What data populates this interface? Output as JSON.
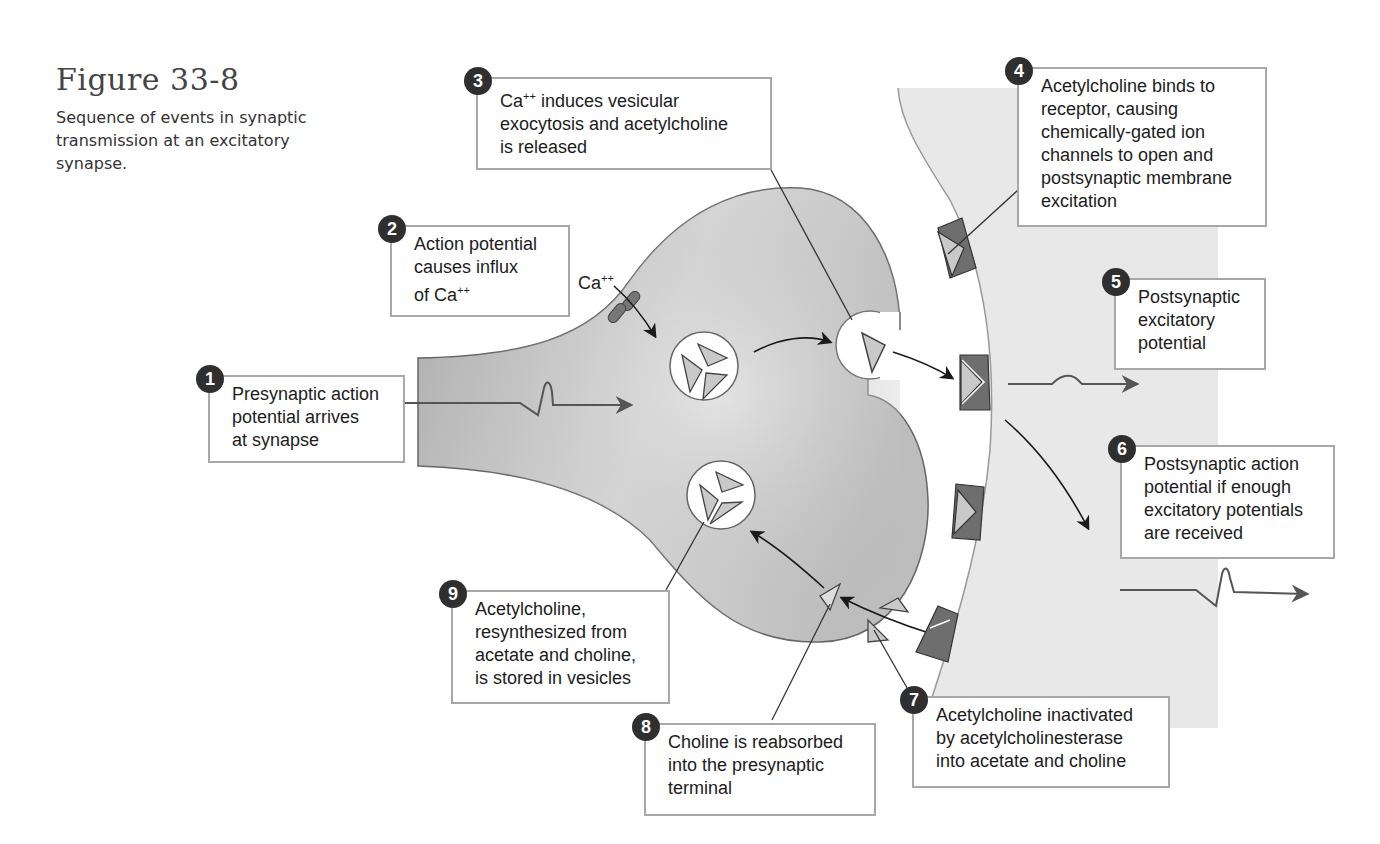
{
  "figure": {
    "title": "Figure 33-8",
    "caption": "Sequence of events in synaptic transmission at an excitatory synapse."
  },
  "labels": {
    "calcium_ion": "Ca",
    "calcium_charge": "++"
  },
  "steps": [
    {
      "number": "1",
      "text": "Presynaptic action\npotential arrives\nat synapse"
    },
    {
      "number": "2",
      "text_pre": "Action potential\ncauses influx\nof Ca",
      "sup": "++"
    },
    {
      "number": "3",
      "text_pre": "Ca",
      "sup": "++",
      "text_post": " induces vesicular\nexocytosis and acetylcholine\nis released"
    },
    {
      "number": "4",
      "text": "Acetylcholine binds to\nreceptor, causing\nchemically-gated ion\nchannels to open and\npostsynaptic membrane\nexcitation"
    },
    {
      "number": "5",
      "text": "Postsynaptic\nexcitatory\npotential"
    },
    {
      "number": "6",
      "text": "Postsynaptic action\npotential if enough\nexcitatory potentials\nare received"
    },
    {
      "number": "7",
      "text": "Acetylcholine inactivated\nby acetylcholinesterase\ninto acetate and choline"
    },
    {
      "number": "8",
      "text": "Choline is reabsorbed\ninto the presynaptic\nterminal"
    },
    {
      "number": "9",
      "text": "Acetylcholine,\nresynthesized from\nacetate and choline,\nis stored in vesicles"
    }
  ],
  "colors": {
    "presynaptic_fill": "#b8b8b8",
    "postsynaptic_fill": "#e6e6e6",
    "receptor_dark": "#6e6e6e",
    "molecule_light": "#c9c9c9",
    "callout_border": "#a8a8a8",
    "badge": "#2f2f2f"
  }
}
